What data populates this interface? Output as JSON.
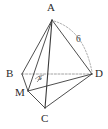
{
  "figure": {
    "type": "geometry-diagram",
    "shape_name": "tetrahedron",
    "background_color": "#ffffff",
    "stroke_color": "#3a3a3a",
    "dashed_color": "#8a8a8a",
    "vertices": [
      {
        "id": "A",
        "label": "A",
        "x": 52,
        "y": 20,
        "label_x": 47,
        "label_y": 3
      },
      {
        "id": "B",
        "label": "B",
        "x": 22,
        "y": 74,
        "label_x": 6,
        "label_y": 68
      },
      {
        "id": "C",
        "label": "C",
        "x": 45,
        "y": 108,
        "label_x": 41,
        "label_y": 114
      },
      {
        "id": "D",
        "label": "D",
        "x": 92,
        "y": 74,
        "label_x": 95,
        "label_y": 68
      },
      {
        "id": "M",
        "label": "M",
        "x": 28,
        "y": 91,
        "label_x": 16,
        "label_y": 88
      }
    ],
    "solid_edges": [
      {
        "from": "A",
        "to": "B"
      },
      {
        "from": "A",
        "to": "C"
      },
      {
        "from": "A",
        "to": "D"
      },
      {
        "from": "A",
        "to": "M"
      },
      {
        "from": "B",
        "to": "M"
      },
      {
        "from": "M",
        "to": "C"
      },
      {
        "from": "M",
        "to": "D"
      },
      {
        "from": "C",
        "to": "D"
      }
    ],
    "dashed_edges": [
      {
        "from": "B",
        "to": "D"
      }
    ],
    "arcs": [
      {
        "id": "measure-arc-AD",
        "from": "A",
        "to": "D",
        "style": "dashed",
        "label": "6",
        "label_x": 77,
        "label_y": 36
      }
    ],
    "angle_marks": [
      {
        "id": "angle-at-M",
        "vertex": "M",
        "label": "x",
        "label_x": 38,
        "label_y": 75
      }
    ]
  }
}
